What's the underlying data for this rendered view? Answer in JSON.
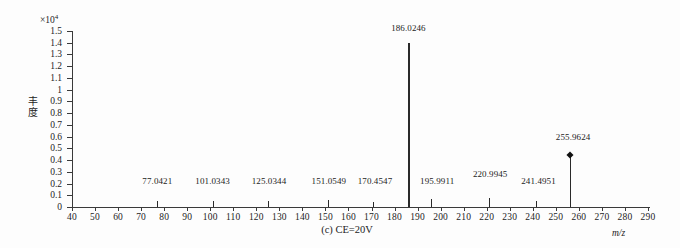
{
  "figure": {
    "caption": "(c) CE=20V",
    "xaxis_unit_label": "m/z",
    "yaxis_label": "丰度",
    "yaxis_exponent_prefix": "×10",
    "yaxis_exponent": "4"
  },
  "chart_data": {
    "type": "bar",
    "title": "(c) CE=20V",
    "xlabel": "m/z",
    "ylabel": "丰度",
    "xlim": [
      40,
      290
    ],
    "ylim": [
      0,
      1.5
    ],
    "y_scale_factor": "×10⁴",
    "grid": false,
    "legend": null,
    "xticks": [
      40,
      50,
      60,
      70,
      80,
      90,
      100,
      110,
      120,
      130,
      140,
      150,
      160,
      170,
      180,
      190,
      200,
      210,
      220,
      230,
      240,
      250,
      260,
      270,
      280,
      290
    ],
    "yticks": [
      0,
      0.1,
      0.2,
      0.3,
      0.4,
      0.5,
      0.6,
      0.7,
      0.8,
      0.9,
      1,
      1.1,
      1.2,
      1.3,
      1.4,
      1.5
    ],
    "x": [
      77.0421,
      101.0343,
      125.0344,
      151.0549,
      170.4547,
      186.0246,
      195.9911,
      220.9945,
      241.4951,
      255.9624
    ],
    "values": [
      0.05,
      0.05,
      0.05,
      0.06,
      0.04,
      1.4,
      0.07,
      0.08,
      0.05,
      0.44
    ],
    "peaks": [
      {
        "mz": "77.0421",
        "x": 77.0421,
        "intensity": 0.05,
        "label_x": 77.0421,
        "label_y": 0.19,
        "marker": false
      },
      {
        "mz": "101.0343",
        "x": 101.0343,
        "intensity": 0.05,
        "label_x": 101.0343,
        "label_y": 0.19,
        "marker": false
      },
      {
        "mz": "125.0344",
        "x": 125.0344,
        "intensity": 0.05,
        "label_x": 125.5,
        "label_y": 0.19,
        "marker": false
      },
      {
        "mz": "151.0549",
        "x": 151.0549,
        "intensity": 0.06,
        "label_x": 151.5,
        "label_y": 0.19,
        "marker": false
      },
      {
        "mz": "170.4547",
        "x": 170.4547,
        "intensity": 0.04,
        "label_x": 171.5,
        "label_y": 0.19,
        "marker": false
      },
      {
        "mz": "186.0246",
        "x": 186.0246,
        "intensity": 1.4,
        "label_x": 186.0246,
        "label_y": 1.49,
        "marker": false
      },
      {
        "mz": "195.9911",
        "x": 195.9911,
        "intensity": 0.07,
        "label_x": 198.5,
        "label_y": 0.19,
        "marker": false
      },
      {
        "mz": "220.9945",
        "x": 220.9945,
        "intensity": 0.08,
        "label_x": 221.5,
        "label_y": 0.25,
        "marker": false
      },
      {
        "mz": "241.4951",
        "x": 241.4951,
        "intensity": 0.05,
        "label_x": 242.5,
        "label_y": 0.19,
        "marker": false
      },
      {
        "mz": "255.9624",
        "x": 255.9624,
        "intensity": 0.44,
        "label_x": 257.5,
        "label_y": 0.56,
        "marker": true
      }
    ]
  }
}
